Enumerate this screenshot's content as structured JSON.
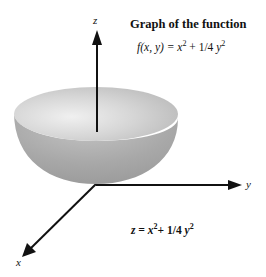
{
  "figure": {
    "title": "Graph of the function",
    "function_lhs": "f(x, y) =",
    "function_rhs_x": "x",
    "function_rhs_x_exp": "2",
    "function_rhs_plus": "+ 1/4",
    "function_rhs_y": "y",
    "function_rhs_y_exp": "2",
    "surface_equation_lhs": "z =",
    "surface_equation_x": "x",
    "surface_equation_x_exp": "2",
    "surface_equation_plus": "+ 1/4",
    "surface_equation_y": "y",
    "surface_equation_y_exp": "2"
  },
  "axes": {
    "x_label": "x",
    "y_label": "y",
    "z_label": "z"
  },
  "colors": {
    "axis": "#111111",
    "surface_outer": "#a9a9a9",
    "surface_inner": "#dcdcdc",
    "background": "#ffffff"
  }
}
